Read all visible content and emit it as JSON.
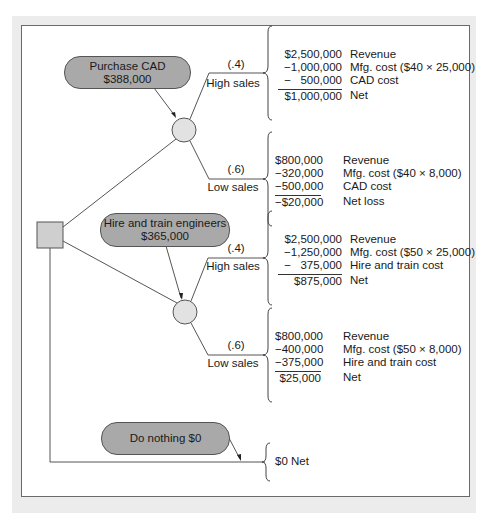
{
  "decision_node": {
    "label": "Decision"
  },
  "alternatives": [
    {
      "name": "Purchase CAD",
      "expected_value": "$388,000",
      "outcomes": [
        {
          "probability": "(.4)",
          "label": "High sales",
          "lines": [
            {
              "amount": "$2,500,000",
              "desc": "Revenue"
            },
            {
              "amount": "−1,000,000",
              "desc": "Mfg. cost ($40 × 25,000)"
            },
            {
              "amount": "−   500,000",
              "desc": "CAD cost"
            }
          ],
          "net": {
            "amount": "$1,000,000",
            "desc": "Net"
          }
        },
        {
          "probability": "(.6)",
          "label": "Low sales",
          "lines": [
            {
              "amount": "$800,000",
              "desc": "Revenue"
            },
            {
              "amount": "−320,000",
              "desc": "Mfg. cost ($40 × 8,000)"
            },
            {
              "amount": "−500,000",
              "desc": "CAD cost"
            }
          ],
          "net": {
            "amount": "−$20,000",
            "desc": "Net loss"
          }
        }
      ]
    },
    {
      "name": "Hire and train engineers",
      "expected_value": "$365,000",
      "outcomes": [
        {
          "probability": "(.4)",
          "label": "High sales",
          "lines": [
            {
              "amount": "$2,500,000",
              "desc": "Revenue"
            },
            {
              "amount": "−1,250,000",
              "desc": "Mfg. cost ($50 × 25,000)"
            },
            {
              "amount": "−   375,000",
              "desc": "Hire and train cost"
            }
          ],
          "net": {
            "amount": "$875,000",
            "desc": "Net"
          }
        },
        {
          "probability": "(.6)",
          "label": "Low sales",
          "lines": [
            {
              "amount": "$800,000",
              "desc": "Revenue"
            },
            {
              "amount": "−400,000",
              "desc": "Mfg. cost ($50 × 8,000)"
            },
            {
              "amount": "−375,000",
              "desc": "Hire and train cost"
            }
          ],
          "net": {
            "amount": "$25,000",
            "desc": "Net"
          }
        }
      ]
    },
    {
      "name": "Do nothing $0",
      "outcome": "$0 Net"
    }
  ],
  "colors": {
    "pill_fill": "#a9a9a9",
    "node_fill": "#e2e2e2",
    "line": "#555555",
    "background": "#ececec"
  }
}
